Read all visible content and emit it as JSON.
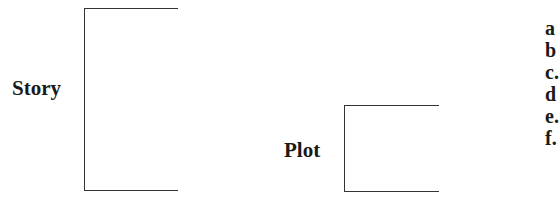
{
  "diagram": {
    "story": {
      "label": "Story"
    },
    "plot": {
      "label": "Plot"
    },
    "items": [
      "a",
      "b",
      "c.",
      "d",
      "e.",
      "f."
    ]
  }
}
